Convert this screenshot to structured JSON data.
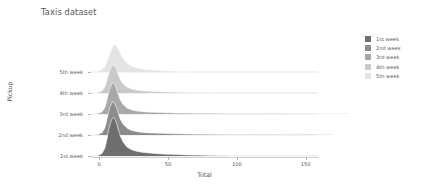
{
  "chart_data": {
    "type": "area",
    "subtype": "ridgeline",
    "title": "Taxis dataset",
    "xlabel": "Total",
    "ylabel": "Pickup",
    "xlim": [
      -6,
      159
    ],
    "xticks": [
      0,
      50,
      100,
      150
    ],
    "xtick_labels": [
      "0",
      "50",
      "100",
      "150"
    ],
    "grid": false,
    "legend_position": "right",
    "categories": [
      "1st week",
      "2nd week",
      "3rd week",
      "4th week",
      "5th week"
    ],
    "row_order_top_to_bottom": [
      "5th week",
      "4th week",
      "3rd week",
      "2nd week",
      "1st week"
    ],
    "colors": [
      "#6e6e6e",
      "#8c8c8c",
      "#a8a8a8",
      "#c9c9c9",
      "#e4e4e4"
    ],
    "series": [
      {
        "name": "1st week",
        "color": "#6e6e6e",
        "baseline_label": "1st week",
        "peak_x": 10.5,
        "peak_height": 38,
        "x_max": 97,
        "x": [
          0,
          3,
          5,
          7,
          9,
          10.5,
          12,
          14,
          16,
          19,
          22,
          26,
          30,
          35,
          40,
          46,
          52,
          60,
          70,
          80,
          90,
          97
        ],
        "density": [
          1,
          5,
          13,
          27,
          36,
          38,
          35,
          26,
          18,
          11,
          7.5,
          5.2,
          4.0,
          3.2,
          2.6,
          2.1,
          1.7,
          1.3,
          0.9,
          0.6,
          0.35,
          0.0
        ]
      },
      {
        "name": "2nd week",
        "color": "#8c8c8c",
        "baseline_label": "2nd week",
        "peak_x": 10,
        "peak_height": 33,
        "x_max": 176,
        "x": [
          0,
          3,
          5,
          7,
          9,
          10,
          12,
          14,
          16,
          19,
          22,
          26,
          32,
          40,
          50,
          62,
          76,
          92,
          110,
          130,
          152,
          176
        ],
        "density": [
          1,
          4.5,
          12,
          24,
          31.5,
          33,
          29,
          21,
          14,
          8.5,
          5.6,
          3.8,
          2.6,
          1.9,
          1.4,
          1.05,
          0.8,
          0.6,
          0.44,
          0.3,
          0.18,
          0.0
        ]
      },
      {
        "name": "3rd week",
        "color": "#a8a8a8",
        "baseline_label": "3rd week",
        "peak_x": 10,
        "peak_height": 31,
        "x_max": 185,
        "x": [
          0,
          3,
          5,
          7,
          9,
          10,
          12,
          14,
          16,
          19,
          22,
          26,
          32,
          40,
          50,
          62,
          76,
          94,
          114,
          136,
          160,
          185
        ],
        "density": [
          1,
          4.2,
          11,
          22,
          29.5,
          31,
          27,
          19,
          12.5,
          7.6,
          5.0,
          3.4,
          2.3,
          1.7,
          1.25,
          0.95,
          0.72,
          0.55,
          0.4,
          0.27,
          0.15,
          0.0
        ]
      },
      {
        "name": "4th week",
        "color": "#c9c9c9",
        "baseline_label": "4th week",
        "peak_x": 10,
        "peak_height": 28,
        "x_max": 83,
        "x": [
          0,
          3,
          5,
          7,
          9,
          10,
          12,
          14,
          16,
          19,
          22,
          26,
          31,
          37,
          44,
          52,
          60,
          68,
          76,
          83
        ],
        "density": [
          1,
          4,
          10,
          20,
          26.5,
          28,
          25,
          18,
          12,
          7.2,
          4.8,
          3.2,
          2.3,
          1.7,
          1.3,
          0.95,
          0.7,
          0.48,
          0.25,
          0.0
        ]
      },
      {
        "name": "5th week",
        "color": "#e4e4e4",
        "baseline_label": "5th week",
        "peak_x": 11,
        "peak_height": 27,
        "x_max": 63,
        "x": [
          0,
          3,
          5,
          7,
          9,
          11,
          13,
          15,
          17,
          20,
          23,
          27,
          31,
          36,
          41,
          46,
          51,
          56,
          60,
          63
        ],
        "density": [
          1.2,
          4,
          9,
          16,
          23,
          27,
          25,
          20,
          14.5,
          9.5,
          6.5,
          4.5,
          3.3,
          2.5,
          1.9,
          1.4,
          1.0,
          0.6,
          0.3,
          0.0
        ]
      }
    ]
  },
  "legend": {
    "items": [
      {
        "label": "1st week",
        "color": "#6e6e6e"
      },
      {
        "label": "2nd week",
        "color": "#8c8c8c"
      },
      {
        "label": "3rd week",
        "color": "#a8a8a8"
      },
      {
        "label": "4th week",
        "color": "#c9c9c9"
      },
      {
        "label": "5th week",
        "color": "#e4e4e4"
      }
    ]
  },
  "axes": {
    "y_tick_labels": [
      "5th week",
      "4th week",
      "3rd week",
      "2nd week",
      "1st week"
    ],
    "x_tick_labels": [
      "0",
      "50",
      "100",
      "150"
    ]
  }
}
